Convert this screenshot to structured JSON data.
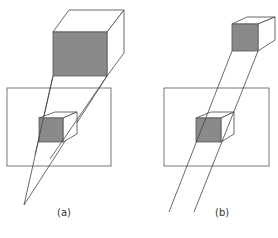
{
  "figure": {
    "panels": [
      {
        "id": "a",
        "label": "(a)",
        "projection": "perspective",
        "colors": {
          "face": "#8a8a8a",
          "line": "#444444",
          "bg": "#ffffff"
        }
      },
      {
        "id": "b",
        "label": "(b)",
        "projection": "parallel",
        "colors": {
          "face": "#8a8a8a",
          "line": "#444444",
          "bg": "#ffffff"
        }
      }
    ]
  }
}
